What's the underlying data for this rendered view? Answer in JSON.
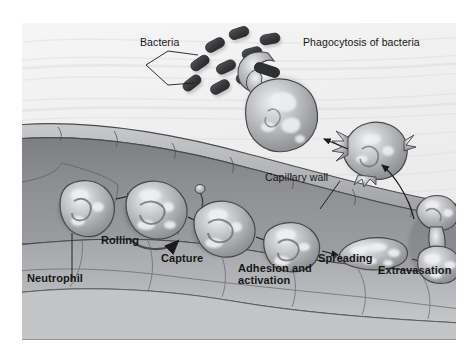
{
  "figure": {
    "medium": "grayscale medical illustration",
    "background_color": "#f1f1f1",
    "ink_color": "#171717"
  },
  "labels": {
    "bacteria": "Bacteria",
    "phagocytosis": "Phagocytosis of bacteria",
    "capillary_wall": "Capillary wall",
    "neutrophil": "Neutrophil",
    "rolling": "Rolling",
    "capture": "Capture",
    "adhesion": "Adhesion and activation",
    "spreading": "Spreading",
    "extravasation": "Extravasation"
  },
  "stages": [
    {
      "name": "Neutrophil",
      "order": 1
    },
    {
      "name": "Rolling",
      "order": 2
    },
    {
      "name": "Capture",
      "order": 3
    },
    {
      "name": "Adhesion and activation",
      "order": 4
    },
    {
      "name": "Spreading",
      "order": 5
    },
    {
      "name": "Extravasation",
      "order": 6
    },
    {
      "name": "Phagocytosis of bacteria",
      "order": 7
    }
  ],
  "colors": {
    "background": "#f1f1f1",
    "vessel_lumen": "#8f9093",
    "vessel_wall": "#a9aaad",
    "endothelium": "#b9babd",
    "cell_body": "#9b9da0",
    "cell_highlight": "#eceef0",
    "bacteria": "#3c3c3e",
    "outline": "#3a3a3c"
  }
}
